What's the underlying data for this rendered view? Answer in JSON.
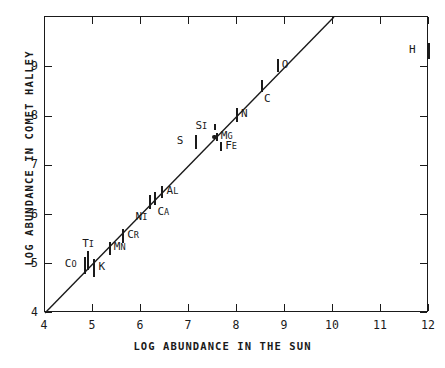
{
  "chart_data": {
    "type": "scatter",
    "title": "",
    "xlabel": "LOG ABUNDANCE IN THE SUN",
    "ylabel": "LOG ABUNDANCE IN COMET HALLEY",
    "xlim": [
      4,
      12
    ],
    "ylim": [
      4,
      10.02
    ],
    "grid": false,
    "legend": "none",
    "xticks": [
      "4",
      "5",
      "6",
      "7",
      "8",
      "9",
      "10",
      "11",
      "12"
    ],
    "xtick_values": [
      4,
      5,
      6,
      7,
      8,
      9,
      10,
      11,
      12
    ],
    "yticks": [
      "4",
      "5",
      "6",
      "7",
      "8",
      "9"
    ],
    "ytick_values": [
      4,
      5,
      6,
      7,
      8,
      9
    ],
    "reference_line": {
      "label": "one-to-one line",
      "x": [
        4,
        10.02
      ],
      "y": [
        4,
        10.02
      ]
    },
    "points": [
      {
        "label": "Co",
        "x": 4.83,
        "y": 4.97,
        "yerr_low": 4.8,
        "yerr_high": 5.14,
        "label_pos": "left"
      },
      {
        "label": "Ti",
        "x": 4.9,
        "y": 5.07,
        "yerr_low": 4.88,
        "yerr_high": 5.26,
        "label_pos": "above"
      },
      {
        "label": "K",
        "x": 5.03,
        "y": 4.92,
        "yerr_low": 4.74,
        "yerr_high": 5.1,
        "label_pos": "right"
      },
      {
        "label": "Mn",
        "x": 5.35,
        "y": 5.31,
        "yerr_low": 5.18,
        "yerr_high": 5.45,
        "label_pos": "right"
      },
      {
        "label": "Cr",
        "x": 5.63,
        "y": 5.56,
        "yerr_low": 5.43,
        "yerr_high": 5.7,
        "label_pos": "right"
      },
      {
        "label": "Ni",
        "x": 6.2,
        "y": 6.26,
        "yerr_low": 6.12,
        "yerr_high": 6.4,
        "label_pos": "below-left"
      },
      {
        "label": "Ca",
        "x": 6.3,
        "y": 6.33,
        "yerr_low": 6.2,
        "yerr_high": 6.47,
        "label_pos": "below-right"
      },
      {
        "label": "Al",
        "x": 6.45,
        "y": 6.45,
        "yerr_low": 6.33,
        "yerr_high": 6.58,
        "label_pos": "right"
      },
      {
        "label": "S",
        "x": 7.16,
        "y": 7.47,
        "yerr_low": 7.34,
        "yerr_high": 7.62,
        "label_pos": "left"
      },
      {
        "label": "Si",
        "x": 7.55,
        "y": 7.78,
        "yerr_low": 7.72,
        "yerr_high": 7.85,
        "label_pos": "left"
      },
      {
        "label": "Mg",
        "x": 7.58,
        "y": 7.58,
        "yerr_low": 7.5,
        "yerr_high": 7.66,
        "label_pos": "right",
        "marker": "dot"
      },
      {
        "label": "Fe",
        "x": 7.67,
        "y": 7.38,
        "yerr_low": 7.29,
        "yerr_high": 7.48,
        "label_pos": "right"
      },
      {
        "label": "N",
        "x": 8.0,
        "y": 8.02,
        "yerr_low": 7.89,
        "yerr_high": 8.16,
        "label_pos": "right"
      },
      {
        "label": "C",
        "x": 8.52,
        "y": 8.6,
        "yerr_low": 8.49,
        "yerr_high": 8.74,
        "label_pos": "below-right"
      },
      {
        "label": "O",
        "x": 8.85,
        "y": 9.02,
        "yerr_low": 8.9,
        "yerr_high": 9.16,
        "label_pos": "right"
      },
      {
        "label": "H",
        "x": 12.0,
        "y": 9.32,
        "yerr_low": 9.16,
        "yerr_high": 9.5,
        "label_pos": "left"
      }
    ]
  },
  "axes": {
    "x_title": "LOG ABUNDANCE IN THE SUN",
    "y_title": "LOG ABUNDANCE IN COMET HALLEY"
  }
}
